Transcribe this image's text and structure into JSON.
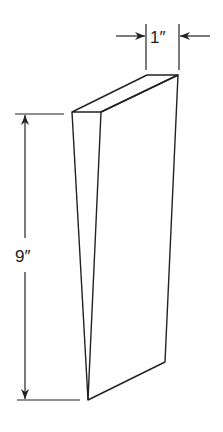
{
  "figure": {
    "type": "technical drawing",
    "colors": {
      "line": "#222222",
      "background": "#ffffff"
    }
  },
  "dimensions": {
    "width": {
      "label": "1″",
      "value": 1,
      "unit": "in"
    },
    "height": {
      "label": "9″",
      "value": 9,
      "unit": "in"
    }
  }
}
